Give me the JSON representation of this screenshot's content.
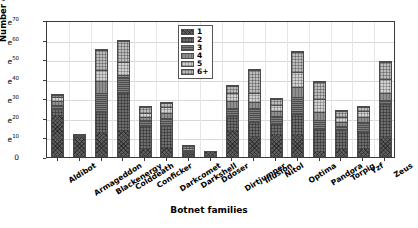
{
  "chart_data": {
    "type": "bar",
    "stacked": true,
    "title": "",
    "xlabel": "Botnet families",
    "ylabel": "Number of Unique IPs",
    "y_scale": "exponential",
    "y_tick_labels": [
      "0",
      "e^10",
      "e^20",
      "e^30",
      "e^40",
      "e^50",
      "e^60",
      "e^70"
    ],
    "y_tick_values": [
      0,
      10,
      20,
      30,
      40,
      50,
      60,
      70
    ],
    "ylim": [
      0,
      70
    ],
    "grid": true,
    "legend_position": "top-center",
    "legend_title": "",
    "categories": [
      "Aldibot",
      "Armageddon",
      "Blackenergy",
      "Colddeath",
      "Conficker",
      "Darkcomet",
      "Darkshell",
      "Ddoser",
      "Dirtjumper",
      "Illusion",
      "Nitol",
      "Optima",
      "Pandora",
      "Torpig",
      "Yzf",
      "Zeus"
    ],
    "series": [
      {
        "name": "1",
        "values": [
          21,
          10,
          12,
          13,
          4,
          4,
          1,
          3,
          13,
          10,
          11,
          11,
          2,
          4,
          4,
          10
        ]
      },
      {
        "name": "2",
        "values": [
          4,
          1,
          11,
          20,
          12,
          12,
          1,
          0,
          8,
          8,
          6,
          11,
          12,
          10,
          9,
          17
        ]
      },
      {
        "name": "3",
        "values": [
          2,
          0,
          10,
          8,
          3,
          4,
          1,
          0,
          4,
          7,
          4,
          9,
          5,
          2,
          5,
          2
        ]
      },
      {
        "name": "4",
        "values": [
          2,
          1,
          6,
          1,
          2,
          3,
          1,
          0,
          4,
          3,
          3,
          5,
          4,
          2,
          3,
          4
        ]
      },
      {
        "name": "5",
        "values": [
          2,
          0,
          6,
          7,
          2,
          3,
          1,
          0,
          4,
          5,
          3,
          8,
          7,
          3,
          3,
          7
        ]
      },
      {
        "name": "6+",
        "values": [
          1,
          0,
          10,
          11,
          3,
          2,
          1,
          0,
          4,
          12,
          3,
          10,
          9,
          3,
          2,
          9
        ]
      }
    ],
    "totals": [
      32,
      12,
      55,
      60,
      26,
      28,
      6,
      3,
      37,
      45,
      30,
      54,
      39,
      24,
      26,
      49
    ],
    "colors": {
      "1": "#5d5d5d",
      "2": "#6e6e6e",
      "3": "#7d7d7d",
      "4": "#8f8f8f",
      "5": "#d2d2d2",
      "6+": "#bdbdbd"
    }
  }
}
